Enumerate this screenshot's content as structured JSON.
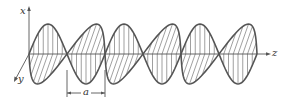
{
  "diagram": {
    "axes": {
      "x_label": "x",
      "y_label": "y",
      "z_label": "z"
    },
    "dimension": {
      "label": "a",
      "from_node": 1,
      "to_node": 2
    },
    "wave": {
      "origin": [
        29,
        54
      ],
      "half_period_px": 38,
      "amplitude_px": 30,
      "num_half_periods": 6,
      "field_1": {
        "name": "E (vertical hatching, x-direction)",
        "first_lobe_sign": 1
      },
      "field_2": {
        "name": "B (diagonal hatching, y-direction in perspective)",
        "first_lobe_sign": -1
      }
    },
    "colors": {
      "line": "#555555",
      "hatch": "#777777",
      "background": "#ffffff"
    }
  }
}
